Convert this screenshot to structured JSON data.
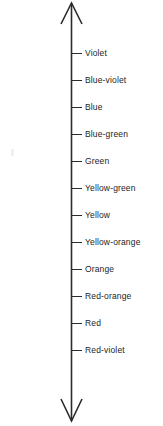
{
  "diagram": {
    "name": "color-spectrum-axis",
    "kind": "double-headed-vertical-arrow-scale",
    "background_color": "#ffffff",
    "line_color": "#2b2b2b",
    "text_color": "#1d1d1d",
    "axis": {
      "top_arrowhead": "open-v-up",
      "bottom_arrowhead": "open-v-down",
      "orientation": "vertical"
    },
    "ticks": [
      {
        "label": "Violet",
        "y": 53
      },
      {
        "label": "Blue-violet",
        "y": 80
      },
      {
        "label": "Blue",
        "y": 107
      },
      {
        "label": "Blue-green",
        "y": 134
      },
      {
        "label": "Green",
        "y": 161
      },
      {
        "label": "Yellow-green",
        "y": 188
      },
      {
        "label": "Yellow",
        "y": 215
      },
      {
        "label": "Yellow-orange",
        "y": 242
      },
      {
        "label": "Orange",
        "y": 269
      },
      {
        "label": "Red-orange",
        "y": 296
      },
      {
        "label": "Red",
        "y": 323
      },
      {
        "label": "Red-violet",
        "y": 350
      }
    ]
  }
}
